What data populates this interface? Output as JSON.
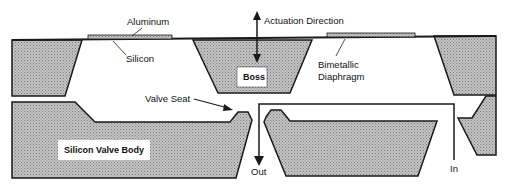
{
  "diagram": {
    "type": "cross-section",
    "colors": {
      "fill": "#b8b8b8",
      "stroke": "#1a1a1a",
      "background": "#ffffff",
      "label_box": "#ffffff"
    },
    "labels": {
      "aluminum": "Aluminum",
      "actuation": "Actuation Direction",
      "silicon": "Silicon",
      "boss": "Boss",
      "bimetallic_1": "Bimetallic",
      "bimetallic_2": "Diaphragm",
      "valve_seat": "Valve Seat",
      "valve_body": "Silicon Valve Body",
      "out": "Out",
      "in": "In"
    }
  }
}
